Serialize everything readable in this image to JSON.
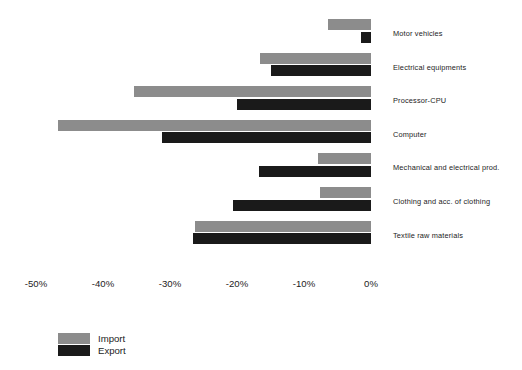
{
  "chart_data": {
    "type": "bar",
    "orientation": "horizontal",
    "title": "",
    "subtitle": "",
    "xlabel": "",
    "ylabel": "",
    "xlim": [
      -55,
      2
    ],
    "xticks": [
      -50,
      -40,
      -30,
      -20,
      -10,
      0
    ],
    "xtick_labels": [
      "-50%",
      "-40%",
      "-30%",
      "-20%",
      "-10%",
      "0%"
    ],
    "grid": false,
    "legend_position": "bottom-left",
    "categories": [
      "Motor vehicles",
      "Electrical equipments",
      "Processor-CPU",
      "Computer",
      "Mechanical and electrical prod.",
      "Clothing and acc. of clothing",
      "Textile raw materials"
    ],
    "series": [
      {
        "name": "Import",
        "color": "#8c8c8c",
        "values": [
          -6.4,
          -16.6,
          -35.4,
          -46.7,
          -7.9,
          -7.6,
          -26.3
        ]
      },
      {
        "name": "Export",
        "color": "#1a1a1a",
        "values": [
          -1.5,
          -14.9,
          -20.0,
          -31.2,
          -16.7,
          -20.6,
          -26.6
        ]
      }
    ]
  },
  "legend": {
    "items": [
      {
        "label": "Import",
        "color": "#8c8c8c"
      },
      {
        "label": "Export",
        "color": "#1a1a1a"
      }
    ]
  }
}
